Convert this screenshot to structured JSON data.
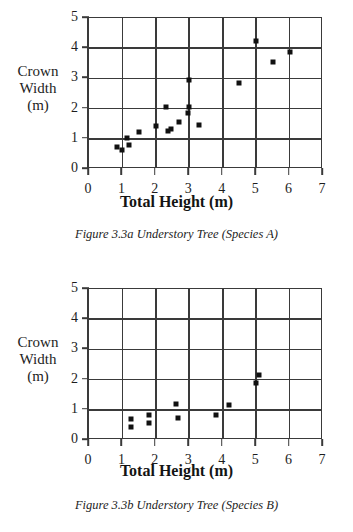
{
  "page": {
    "background": "#ffffff",
    "ink_color": "#111111",
    "grid_color": "#3a3a3a"
  },
  "figures": [
    {
      "id": "figure-a",
      "caption": "Figure 3.3a Understory Tree (Species A)",
      "ylabel_lines": [
        "Crown",
        "Width",
        "(m)"
      ],
      "xlabel": "Total Height (m)",
      "xticks": [
        "0",
        "1",
        "2",
        "3",
        "4",
        "5",
        "6",
        "7"
      ],
      "yticks": [
        "0",
        "1",
        "2",
        "3",
        "4",
        "5"
      ]
    },
    {
      "id": "figure-b",
      "caption": "Figure 3.3b Understory Tree (Species B)",
      "ylabel_lines": [
        "Crown",
        "Width",
        "(m)"
      ],
      "xlabel": "Total Height (m)",
      "xticks": [
        "0",
        "1",
        "2",
        "3",
        "4",
        "5",
        "6",
        "7"
      ],
      "yticks": [
        "0",
        "1",
        "2",
        "3",
        "4",
        "5"
      ]
    }
  ],
  "chart_data": [
    {
      "type": "scatter",
      "title": "Figure 3.3a Understory Tree (Species A)",
      "xlabel": "Total Height (m)",
      "ylabel": "Crown Width (m)",
      "xlim": [
        0,
        7
      ],
      "ylim": [
        0,
        5
      ],
      "xticks": [
        0,
        1,
        2,
        3,
        4,
        5,
        6,
        7
      ],
      "yticks": [
        0,
        1,
        2,
        3,
        4,
        5
      ],
      "grid": true,
      "legend": false,
      "marker": "square",
      "points": [
        {
          "x": 0.85,
          "y": 0.72
        },
        {
          "x": 1.0,
          "y": 0.62
        },
        {
          "x": 1.15,
          "y": 1.03
        },
        {
          "x": 1.2,
          "y": 0.81
        },
        {
          "x": 1.5,
          "y": 1.23
        },
        {
          "x": 2.0,
          "y": 1.44
        },
        {
          "x": 2.3,
          "y": 2.04
        },
        {
          "x": 2.35,
          "y": 1.27
        },
        {
          "x": 2.45,
          "y": 1.33
        },
        {
          "x": 2.7,
          "y": 1.56
        },
        {
          "x": 2.95,
          "y": 1.84
        },
        {
          "x": 3.0,
          "y": 2.04
        },
        {
          "x": 3.0,
          "y": 2.95
        },
        {
          "x": 3.3,
          "y": 1.46
        },
        {
          "x": 4.5,
          "y": 2.86
        },
        {
          "x": 5.0,
          "y": 4.25
        },
        {
          "x": 5.5,
          "y": 3.54
        },
        {
          "x": 6.0,
          "y": 3.86
        }
      ]
    },
    {
      "type": "scatter",
      "title": "Figure 3.3b Understory Tree (Species B)",
      "xlabel": "Total Height (m)",
      "ylabel": "Crown Width (m)",
      "xlim": [
        0,
        7
      ],
      "ylim": [
        0,
        5
      ],
      "xticks": [
        0,
        1,
        2,
        3,
        4,
        5,
        6,
        7
      ],
      "yticks": [
        0,
        1,
        2,
        3,
        4,
        5
      ],
      "grid": true,
      "legend": false,
      "marker": "square",
      "points": [
        {
          "x": 1.25,
          "y": 0.7
        },
        {
          "x": 1.25,
          "y": 0.43
        },
        {
          "x": 1.8,
          "y": 0.82
        },
        {
          "x": 1.8,
          "y": 0.55
        },
        {
          "x": 2.6,
          "y": 1.19
        },
        {
          "x": 2.65,
          "y": 0.73
        },
        {
          "x": 3.8,
          "y": 0.83
        },
        {
          "x": 4.2,
          "y": 1.16
        },
        {
          "x": 5.1,
          "y": 2.15
        },
        {
          "x": 5.0,
          "y": 1.88
        }
      ]
    }
  ]
}
